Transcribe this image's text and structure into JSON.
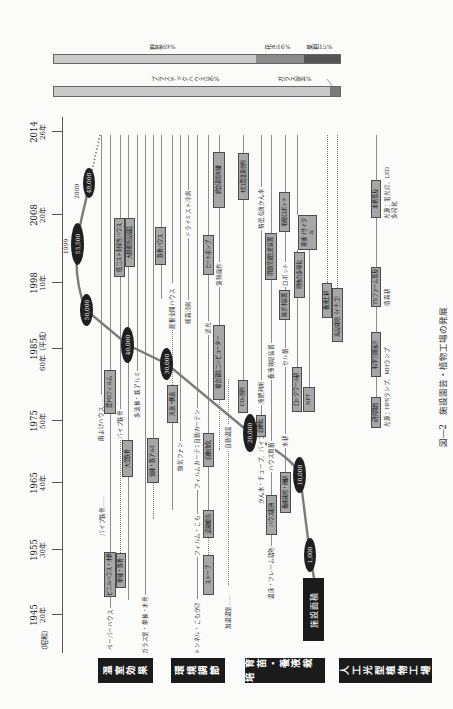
{
  "figure": {
    "caption": "図―2　施設園芸・植物工場の発展"
  },
  "timeline": {
    "era_showa": "（昭和）",
    "ticks": [
      {
        "year": "1945",
        "era": "20年"
      },
      {
        "year": "1955",
        "era": "30年"
      },
      {
        "year": "1965",
        "era": "40年"
      },
      {
        "year": "1975",
        "era": "50年"
      },
      {
        "year": "1985",
        "era": "60年（平成）"
      },
      {
        "year": "1998",
        "era": "10年"
      },
      {
        "year": "2008",
        "era": "20年"
      },
      {
        "year": "2014",
        "era": "26年"
      }
    ]
  },
  "area": {
    "title": "施設面積",
    "milestones": [
      "1,000",
      "10,000",
      "20,000",
      "30,000",
      "40,000",
      "50,000",
      "53,500",
      "49,000"
    ],
    "peak_year": "1999",
    "recent_year": "2009"
  },
  "categories": {
    "greenhouse": "温室効果",
    "environment": "環境調節",
    "nursery": "育苗・養液栽培",
    "plant_factory": "人工光型植物工場"
  },
  "greenhouse_items": {
    "rain_shelter": "雨よけハウス……",
    "paper_house": "ペーパーハウス",
    "vinyl_wood": "ビニルハウス・木骨",
    "pipe_steel_1": "パイプ鉄骨……",
    "po_film": "農POフィルム",
    "single_steel": "単棟・鉄骨",
    "pipe_steel_2": "パイプ鉄骨",
    "low_cost": "低コスト耐候性ハウス",
    "large_steel": "大型鉄骨",
    "large_scale": "大規模施設園芸",
    "multi_span_label": "多連棟・鉄アルミ",
    "glass_house": "ガラス室・単棟・木骨",
    "multi_span_box": "連棟・鉄アルミ",
    "steel_house": "鉄骨ハウス"
  },
  "environment_items": {
    "roof_side_vent": "天窓・側窓",
    "open_roof": "屋根全開ハウス",
    "vent_fan": "換気ファン",
    "fog_cooling": "細霧冷房",
    "dry_mist": "ドライミスト冷房",
    "tunnel": "トンネル・こもかけ",
    "film_komo": "フィルム・こも",
    "film_curtain": "フィルムカーテン",
    "auto_curtain": "自動カーテン",
    "stove": "ストーブ",
    "warm_air": "温風暖房",
    "auto_vent": "自動換気",
    "shading": "遮光",
    "heat_pump": "ヒートポンプ",
    "env_computer": "複合環境コンピューター",
    "remote": "遠隔操作",
    "integrated": "統合環境制御",
    "heated_house": "加温温室……",
    "auto_temp": "自動温湿",
    "co2": "CO₂施用",
    "zero_co2": "ゼロ濃度差施用"
  },
  "nursery_items": {
    "irrigation_tube": "かん水・チューブ、パイプ",
    "automation": "自動化",
    "liquid_fert": "液肥利用",
    "drip": "精密点滴かん水",
    "hotbed": "温床・フレーム踏熱",
    "house_electric": "ハウス電熱",
    "house_nursery": "ハウス育苗",
    "hydro_devices": "養液栽培装置",
    "closed_seedling": "閉鎖型苗生産装置",
    "gravel": "養液栽培・礫耕",
    "water_culture": "水耕",
    "cell_seedling": "セル苗",
    "grafting": "接ぎ木装置",
    "robot": "ロボット",
    "harvest_robot": "収穫ロボット",
    "rockwool": "ロックウール耕",
    "media": "培地の多様化",
    "recycle": "排液リサイクル",
    "nft": "NFT",
    "fertigation": "養液土耕",
    "elevated": "高設栽培（イチゴ）"
  },
  "plant_factory_items": {
    "research_start": "研究開始",
    "expo": "科学万博展示",
    "light_hps": "光源：HPSランプ、MHランプ",
    "ts_farm": "TSファーム普及",
    "aeroponics": "噴霧耕",
    "full_spread": "本格普及",
    "light_led": "光源：蛍光灯、LED",
    "multi_tier": "多段化"
  },
  "share_bars": {
    "crops": [
      {
        "label": "野菜69%",
        "value": 69,
        "color": "#cacaca"
      },
      {
        "label": "花き16%",
        "value": 16,
        "color": "#8c8c8c"
      },
      {
        "label": "果樹15%",
        "value": 15,
        "color": "#555555"
      }
    ],
    "structures": [
      {
        "label": "プラスチックハウス96%",
        "value": 96,
        "color": "#cacaca"
      },
      {
        "label": "ガラス室4%",
        "value": 4,
        "color": "#7a7a7a"
      }
    ]
  }
}
